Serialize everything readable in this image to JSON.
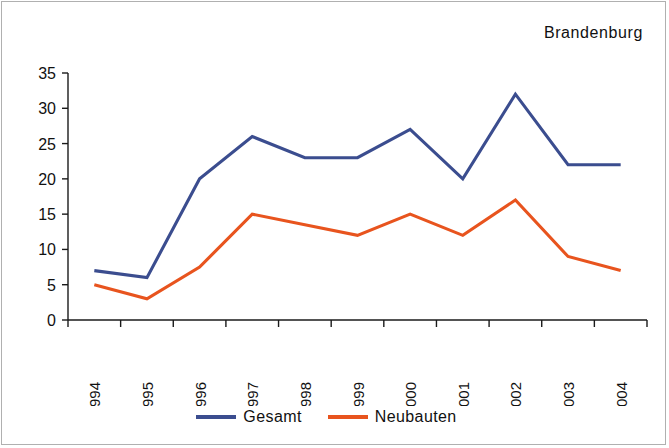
{
  "chart_data": {
    "type": "line",
    "title": "Brandenburg",
    "xlabel": "",
    "ylabel": "",
    "categories": [
      "1994",
      "1995",
      "1996",
      "1997",
      "1998",
      "1999",
      "2000",
      "2001",
      "2002",
      "2003",
      "2004"
    ],
    "series": [
      {
        "name": "Gesamt",
        "color": "#3B4D8F",
        "values": [
          7,
          6,
          20,
          26,
          23,
          23,
          27,
          20,
          32,
          22,
          22
        ]
      },
      {
        "name": "Neubauten",
        "color": "#E8541E",
        "values": [
          5,
          3,
          7.5,
          15,
          13.5,
          12,
          15,
          12,
          17,
          9,
          7
        ]
      }
    ],
    "ylim": [
      0,
      35
    ],
    "y_ticks": [
      0,
      5,
      10,
      15,
      20,
      25,
      30,
      35
    ],
    "y_tick_labels": [
      "0",
      "5",
      "10",
      "15",
      "20",
      "25",
      "30",
      "35"
    ],
    "grid": false,
    "legend_position": "bottom-right",
    "x_tick_rotation": 90
  }
}
